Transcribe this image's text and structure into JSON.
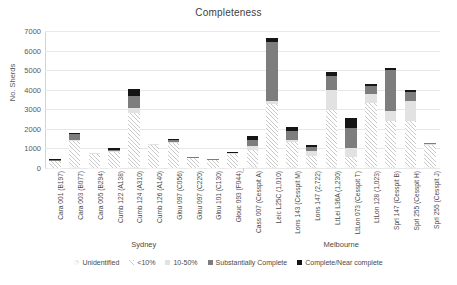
{
  "chart_data": {
    "type": "bar",
    "subtype": "stacked-bar",
    "title": "Completeness",
    "xlabel": "",
    "ylabel": "No. Sherds",
    "ylim": [
      0,
      7000
    ],
    "yticks": [
      0,
      1000,
      2000,
      3000,
      4000,
      5000,
      6000,
      7000
    ],
    "ytick_labels": [
      "0",
      "1000",
      "2000",
      "3000",
      "4000",
      "5000",
      "6000",
      "7000"
    ],
    "grid": true,
    "grid_axis": "y",
    "legend_position": "bottom",
    "legend": [
      "Unidentified",
      "<10%",
      "10-50%",
      "Substantially Complete",
      "Complete/Near complete"
    ],
    "series_colors": [
      "#f2f2f2",
      "#ffffff",
      "#e2e2e2",
      "#7d7d7d",
      "#151515"
    ],
    "categories": [
      "Cara 001 (B197)",
      "Cara 003 (B077)",
      "Cara 005 (B294)",
      "Cumb 122 (A138)",
      "Cumb 124 (A310)",
      "Cumb 126 (A140)",
      "Glou 097 (C056)",
      "Glou 097 (C220)",
      "Glou 101 (C130)",
      "Glouc 093 (F044)",
      "Cass 007 (Cesspit A)",
      "Leic L25C (1,010)",
      "Lons 143 (Cesspit M)",
      "Lons 147 (2,722)",
      "LtLei L36A (1,230)",
      "LtLon 073 (Cesspit T)",
      "LtLon 128 (1,023)",
      "Sprl 147 (Cesspit B)",
      "Sprl 255 (Cesspit H)",
      "Sprl 255 (Cesspit J)"
    ],
    "groups": [
      {
        "label": "Sydney",
        "start": 0,
        "end": 9
      },
      {
        "label": "Melbourne",
        "start": 10,
        "end": 19
      }
    ],
    "series": [
      {
        "name": "Unidentified",
        "values": [
          20,
          30,
          20,
          20,
          40,
          20,
          20,
          20,
          20,
          20,
          120,
          30,
          40,
          40,
          30,
          30,
          30,
          30,
          30,
          30
        ]
      },
      {
        "name": "<10%",
        "values": [
          330,
          1340,
          700,
          810,
          2750,
          1160,
          1270,
          470,
          380,
          700,
          800,
          3220,
          1280,
          580,
          2910,
          520,
          3280,
          2370,
          2370,
          1140
        ]
      },
      {
        "name": "10-50%",
        "values": [
          20,
          60,
          30,
          30,
          290,
          30,
          40,
          30,
          20,
          30,
          180,
          200,
          90,
          230,
          1030,
          480,
          470,
          520,
          1000,
          60
        ]
      },
      {
        "name": "Substantially Complete",
        "values": [
          60,
          300,
          20,
          60,
          600,
          20,
          100,
          30,
          20,
          30,
          330,
          3000,
          480,
          200,
          720,
          1000,
          400,
          2090,
          470,
          40
        ]
      },
      {
        "name": "Complete/Near complete",
        "values": [
          30,
          80,
          10,
          80,
          340,
          10,
          70,
          20,
          10,
          20,
          210,
          200,
          190,
          110,
          230,
          520,
          130,
          80,
          130,
          30
        ]
      }
    ],
    "totals": [
      460,
      1810,
      780,
      1000,
      4020,
      1240,
      1500,
      570,
      450,
      800,
      1640,
      6650,
      2080,
      1160,
      4920,
      2550,
      4310,
      5090,
      4000,
      1300
    ]
  }
}
